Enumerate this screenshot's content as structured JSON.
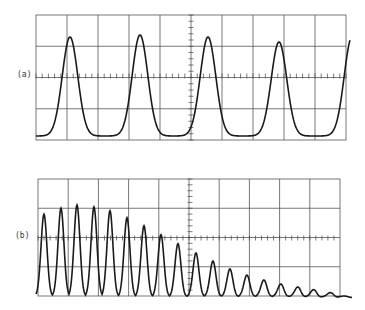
{
  "panels": [
    {
      "label": "(a)",
      "description": "Periodic train of peaks with constant amplitude (4 peaks)",
      "grid": {
        "x0": 36,
        "x1": 346,
        "y0": 15,
        "y1": 140,
        "cols": 10,
        "rows": 4,
        "axis_y": 76,
        "axis_x": 191
      },
      "baseline_y": 136,
      "peaks": [
        {
          "x": 70,
          "y": 37
        },
        {
          "x": 140,
          "y": 35
        },
        {
          "x": 208,
          "y": 37
        },
        {
          "x": 279,
          "y": 42
        }
      ]
    },
    {
      "label": "(b)",
      "description": "Train of peaks with amplitude rising then decaying",
      "grid": {
        "x0": 38,
        "x1": 340,
        "y0": 179,
        "y1": 296,
        "cols": 10,
        "rows": 4,
        "axis_y": 238,
        "axis_x": 190
      },
      "baseline_y": 296,
      "peaks": [
        {
          "x": 44,
          "y": 213
        },
        {
          "x": 61,
          "y": 207
        },
        {
          "x": 77,
          "y": 204
        },
        {
          "x": 94,
          "y": 206
        },
        {
          "x": 110,
          "y": 210
        },
        {
          "x": 127,
          "y": 217
        },
        {
          "x": 144,
          "y": 225
        },
        {
          "x": 161,
          "y": 234
        },
        {
          "x": 178,
          "y": 243
        },
        {
          "x": 196,
          "y": 252
        },
        {
          "x": 213,
          "y": 260
        },
        {
          "x": 230,
          "y": 268
        },
        {
          "x": 247,
          "y": 274
        },
        {
          "x": 264,
          "y": 279
        },
        {
          "x": 281,
          "y": 283
        },
        {
          "x": 298,
          "y": 286
        },
        {
          "x": 314,
          "y": 289
        },
        {
          "x": 331,
          "y": 292
        }
      ]
    }
  ]
}
